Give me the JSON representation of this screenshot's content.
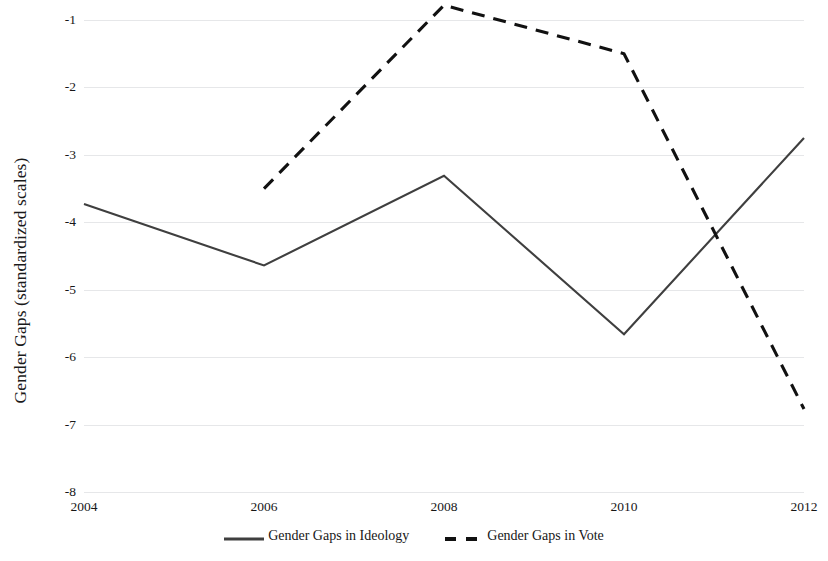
{
  "chart_data": {
    "type": "line",
    "title": "",
    "xlabel": "",
    "ylabel": "Gender Gaps (standardized scales)",
    "x": [
      2004,
      2006,
      2008,
      2010,
      2012
    ],
    "categories": [
      "2004",
      "2006",
      "2008",
      "2010",
      "2012"
    ],
    "xlim": [
      2004,
      2012
    ],
    "ylim": [
      -8,
      -1
    ],
    "yticks": [
      -1,
      -2,
      -3,
      -4,
      -5,
      -6,
      -7,
      -8
    ],
    "ytick_labels": [
      "-1",
      "-2",
      "-3",
      "-4",
      "-5",
      "-6",
      "-7",
      "-8"
    ],
    "grid": true,
    "grid_axis": "y",
    "legend_position": "bottom",
    "series": [
      {
        "name": "Gender Gaps in Ideology",
        "style": "solid",
        "color": "#3f3f3f",
        "x": [
          2004,
          2006,
          2008,
          2010,
          2012
        ],
        "values": [
          -3.73,
          -4.64,
          -3.31,
          -5.66,
          -2.75
        ]
      },
      {
        "name": "Gender Gaps in Vote",
        "style": "dashed",
        "color": "#111111",
        "x": [
          2006,
          2008,
          2010,
          2012
        ],
        "values": [
          -3.5,
          -0.78,
          -1.5,
          -6.77
        ]
      }
    ]
  },
  "axes": {
    "y_title": "Gender Gaps (standardized scales)",
    "y_tick_labels": [
      "-1",
      "-2",
      "-3",
      "-4",
      "-5",
      "-6",
      "-7",
      "-8"
    ],
    "x_tick_labels": [
      "2004",
      "2006",
      "2008",
      "2010",
      "2012"
    ]
  },
  "legend": {
    "items": [
      {
        "label": "Gender Gaps in Ideology",
        "style": "solid"
      },
      {
        "label": "Gender Gaps in Vote",
        "style": "dashed"
      }
    ]
  },
  "colors": {
    "ideology_line": "#3f3f3f",
    "vote_line": "#111111",
    "gridline": "#e6e7e9",
    "text": "#171717",
    "background": "#ffffff"
  }
}
